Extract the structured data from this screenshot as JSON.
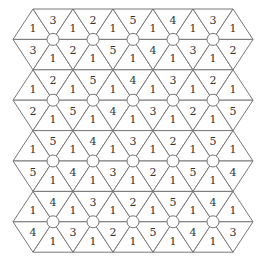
{
  "puzzle": {
    "type": "triangular-grid-number-puzzle",
    "rows": [
      {
        "top": [
          1,
          3,
          1,
          2,
          1,
          5,
          1,
          4,
          1,
          3,
          1
        ],
        "bottom": [
          3,
          1,
          2,
          1,
          5,
          1,
          4,
          1,
          3,
          1,
          2
        ]
      },
      {
        "top": [
          1,
          2,
          1,
          5,
          1,
          4,
          1,
          3,
          1,
          2,
          1
        ],
        "bottom": [
          2,
          1,
          5,
          1,
          4,
          1,
          3,
          1,
          2,
          1,
          5
        ]
      },
      {
        "top": [
          1,
          5,
          1,
          4,
          1,
          3,
          1,
          2,
          1,
          5,
          1
        ],
        "bottom": [
          5,
          1,
          4,
          1,
          3,
          1,
          2,
          1,
          5,
          1,
          4
        ]
      },
      {
        "top": [
          1,
          4,
          1,
          3,
          1,
          2,
          1,
          5,
          1,
          4,
          1
        ],
        "bottom": [
          4,
          1,
          3,
          1,
          2,
          1,
          5,
          1,
          4,
          1,
          3
        ]
      }
    ],
    "nodes_per_row": 5,
    "colors": {
      "line": "#777777",
      "text": "#333333",
      "node_fill": "#ffffff",
      "background": "#ffffff"
    }
  }
}
